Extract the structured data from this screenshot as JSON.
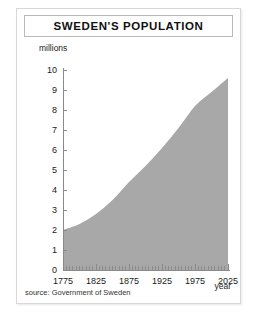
{
  "figure": {
    "title": "SWEDEN'S POPULATION",
    "source_note": "source: Government of Sweden",
    "fill_color": "#a8a8a8",
    "axis_color": "#8a8a8a",
    "background_color": "#ffffff",
    "border_color": "#d8d8d8"
  },
  "chart_data": {
    "type": "area",
    "title": "SWEDEN'S POPULATION",
    "xlabel": "year",
    "ylabel": "millions",
    "xlim": [
      1775,
      2025
    ],
    "ylim": [
      0,
      10
    ],
    "grid": false,
    "legend": null,
    "xticks": [
      1775,
      1825,
      1875,
      1925,
      1975,
      2025
    ],
    "xtick_labels": [
      "1775",
      "1825",
      "1875",
      "1925",
      "1975",
      "2025"
    ],
    "x_minor_tick_interval": 5,
    "yticks": [
      0,
      1,
      2,
      3,
      4,
      5,
      6,
      7,
      8,
      9,
      10
    ],
    "ytick_labels": [
      "0",
      "1",
      "2",
      "3",
      "4",
      "5",
      "6",
      "7",
      "8",
      "9",
      "10"
    ],
    "x": [
      1775,
      1800,
      1825,
      1850,
      1875,
      1900,
      1925,
      1950,
      1975,
      2000,
      2025
    ],
    "values": [
      2.0,
      2.3,
      2.8,
      3.5,
      4.4,
      5.2,
      6.1,
      7.1,
      8.2,
      8.9,
      9.6
    ],
    "series": [
      {
        "name": "Population (millions)",
        "values": [
          2.0,
          2.3,
          2.8,
          3.5,
          4.4,
          5.2,
          6.1,
          7.1,
          8.2,
          8.9,
          9.6
        ]
      }
    ],
    "annotations": [
      "source: Government of Sweden"
    ]
  }
}
